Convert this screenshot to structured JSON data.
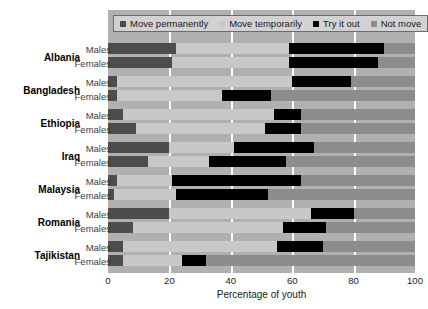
{
  "chart_data": {
    "type": "bar",
    "orientation": "horizontal",
    "stacked": true,
    "title": "",
    "xlabel": "Percentage of youth",
    "ylabel": "",
    "xlim": [
      0,
      100
    ],
    "xticks": [
      0,
      20,
      40,
      60,
      80,
      100
    ],
    "grid": "vertical-white-gridlines",
    "legend_position": "top",
    "categories": [
      "Albania Males",
      "Albania Females",
      "Bangladesh Males",
      "Bangladesh Females",
      "Ethiopia Males",
      "Ethiopia Females",
      "Iraq Males",
      "Iraq Females",
      "Malaysia Males",
      "Malaysia Females",
      "Romania Males",
      "Romania Females",
      "Tajikistan Males",
      "Tajikistan Females"
    ],
    "series": [
      {
        "name": "Move permanently",
        "color": "#4d4d4d",
        "values": [
          22,
          21,
          3,
          3,
          5,
          9,
          20,
          13,
          3,
          2,
          20,
          8,
          5,
          5
        ]
      },
      {
        "name": "Move temporarily",
        "color": "#c8c8c8",
        "values": [
          37,
          38,
          57,
          34,
          49,
          42,
          21,
          20,
          18,
          20,
          46,
          49,
          50,
          19
        ]
      },
      {
        "name": "Try it out",
        "color": "#000000",
        "values": [
          31,
          29,
          19,
          16,
          9,
          12,
          26,
          25,
          42,
          30,
          14,
          14,
          15,
          8
        ]
      },
      {
        "name": "Not move",
        "color": "#8c8c8c",
        "values": [
          10,
          12,
          21,
          47,
          37,
          37,
          33,
          42,
          37,
          48,
          20,
          29,
          30,
          68
        ]
      }
    ]
  },
  "legend": {
    "items": [
      {
        "label": "Move permanently",
        "color": "#4d4d4d",
        "icon": "square-swatch-icon"
      },
      {
        "label": "Move temporarily",
        "color": "#c8c8c8",
        "icon": "square-swatch-icon"
      },
      {
        "label": "Try it out",
        "color": "#000000",
        "icon": "square-swatch-icon"
      },
      {
        "label": "Not move",
        "color": "#8c8c8c",
        "icon": "square-swatch-icon"
      }
    ]
  },
  "axes": {
    "x_title": "Percentage of youth",
    "x_tick_labels": [
      "0",
      "20",
      "40",
      "60",
      "80",
      "100"
    ]
  },
  "countries": [
    {
      "name": "Albania",
      "rows": [
        {
          "sex": "Males",
          "segments": [
            22,
            37,
            31,
            10
          ]
        },
        {
          "sex": "Females",
          "segments": [
            21,
            38,
            29,
            12
          ]
        }
      ]
    },
    {
      "name": "Bangladesh",
      "rows": [
        {
          "sex": "Males",
          "segments": [
            3,
            57,
            19,
            21
          ]
        },
        {
          "sex": "Females",
          "segments": [
            3,
            34,
            16,
            47
          ]
        }
      ]
    },
    {
      "name": "Ethiopia",
      "rows": [
        {
          "sex": "Males",
          "segments": [
            5,
            49,
            9,
            37
          ]
        },
        {
          "sex": "Females",
          "segments": [
            9,
            42,
            12,
            37
          ]
        }
      ]
    },
    {
      "name": "Iraq",
      "rows": [
        {
          "sex": "Males",
          "segments": [
            20,
            21,
            26,
            33
          ]
        },
        {
          "sex": "Females",
          "segments": [
            13,
            20,
            25,
            42
          ]
        }
      ]
    },
    {
      "name": "Malaysia",
      "rows": [
        {
          "sex": "Males",
          "segments": [
            3,
            18,
            42,
            37
          ]
        },
        {
          "sex": "Females",
          "segments": [
            2,
            20,
            30,
            48
          ]
        }
      ]
    },
    {
      "name": "Romania",
      "rows": [
        {
          "sex": "Males",
          "segments": [
            20,
            46,
            14,
            20
          ]
        },
        {
          "sex": "Females",
          "segments": [
            8,
            49,
            14,
            29
          ]
        }
      ]
    },
    {
      "name": "Tajikistan",
      "rows": [
        {
          "sex": "Males",
          "segments": [
            5,
            50,
            15,
            30
          ]
        },
        {
          "sex": "Females",
          "segments": [
            5,
            19,
            8,
            68
          ]
        }
      ]
    }
  ]
}
